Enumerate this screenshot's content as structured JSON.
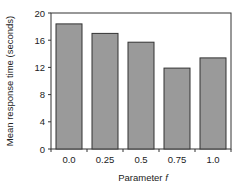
{
  "chart_data": {
    "type": "bar",
    "title": "",
    "xlabel": "Parameter f",
    "xlabel_prefix": "Parameter ",
    "xlabel_var": "f",
    "ylabel": "Mean response time (seconds)",
    "categories": [
      "0.0",
      "0.25",
      "0.5",
      "0.75",
      "1.0"
    ],
    "values": [
      18.4,
      17.0,
      15.7,
      11.9,
      13.4
    ],
    "ylim": [
      0,
      20
    ],
    "yticks": [
      0,
      4,
      8,
      12,
      16,
      20
    ],
    "grid": false,
    "legend": null,
    "colors": {
      "bar_fill": "#9a9a9a",
      "bar_edge": "#333333",
      "axis": "#333333"
    }
  }
}
